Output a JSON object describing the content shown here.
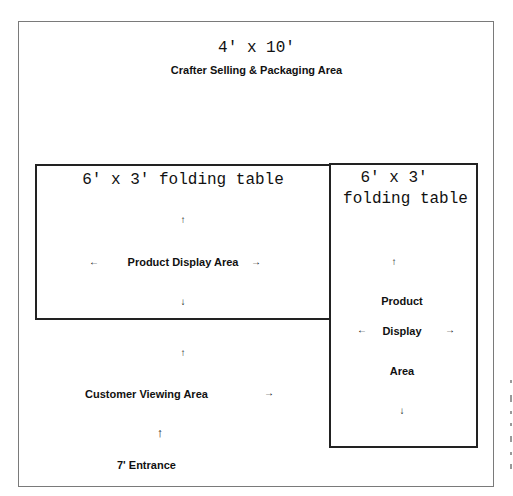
{
  "outer_area": {
    "dimension": "4' x 10'",
    "title": "Crafter Selling & Packaging Area"
  },
  "table_left": {
    "label": "6' x 3' folding table",
    "area_label": "Product Display Area",
    "arrows": {
      "up": "↑",
      "down": "↓",
      "left": "←",
      "right": "→"
    }
  },
  "table_right": {
    "label_line1": "6' x 3'",
    "label_line2": "folding table",
    "area_line1": "Product",
    "area_line2": "Display",
    "area_line3": "Area",
    "arrows": {
      "up": "↑",
      "down": "↓",
      "left": "←",
      "right": "→"
    }
  },
  "customer_area": {
    "label": "Customer Viewing Area",
    "arrow_up": "↑",
    "arrow_right": "→"
  },
  "entrance": {
    "arrow": "↑",
    "label": "7' Entrance"
  },
  "colors": {
    "border": "#222222",
    "outer_border": "#7a7a7a",
    "background": "#ffffff"
  }
}
